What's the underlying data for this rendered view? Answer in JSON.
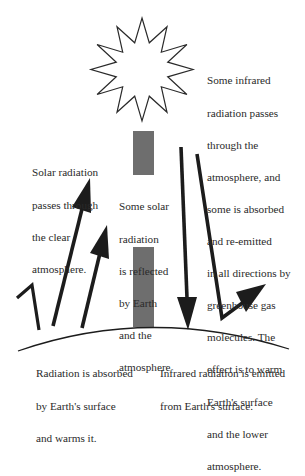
{
  "diagram": {
    "colors": {
      "ink": "#1c1c1c",
      "reflected_bar": "#6e6e6e",
      "background": "#ffffff"
    },
    "elements": {
      "sun": "sun-star-icon",
      "earth_surface": "earth-surface-curve"
    },
    "labels": {
      "solar_passes": {
        "lines": [
          "Solar radiation",
          "passes through",
          "the clear",
          "atmosphere."
        ]
      },
      "reflected": {
        "lines": [
          "Some solar",
          "radiation",
          "is reflected",
          "by Earth",
          "and the",
          "atmosphere"
        ]
      },
      "infrared_greenhouse": {
        "lines": [
          "Some infrared",
          "radiation passes",
          "through the",
          "atmosphere, and",
          "some is absorbed",
          "and re-emitted",
          "in all directions by",
          "greenhouse gas",
          "molecules. The",
          "effect is to warm",
          "Earth's surface",
          "and the lower",
          "atmosphere."
        ]
      },
      "absorbed": {
        "lines": [
          "Radiation is absorbed",
          "by Earth's surface",
          "and warms it."
        ]
      },
      "infrared_emitted": {
        "lines": [
          "Infrared radiation is emitted",
          "from Earth's surface."
        ]
      }
    }
  }
}
